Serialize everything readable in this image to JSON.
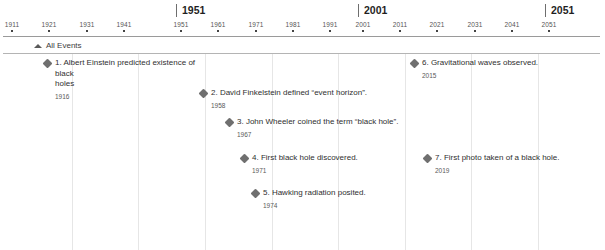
{
  "axis": {
    "major_labels": [
      {
        "text": "1951",
        "x": 176
      },
      {
        "text": "2001",
        "x": 358
      },
      {
        "text": "2051",
        "x": 545
      }
    ],
    "ticks": [
      {
        "label": "1911",
        "x": 12
      },
      {
        "label": "1921",
        "x": 49
      },
      {
        "label": "1931",
        "x": 87
      },
      {
        "label": "1941",
        "x": 124
      },
      {
        "label": "1951",
        "x": 181
      },
      {
        "label": "1961",
        "x": 218
      },
      {
        "label": "1971",
        "x": 256
      },
      {
        "label": "1981",
        "x": 293
      },
      {
        "label": "1991",
        "x": 330
      },
      {
        "label": "2001",
        "x": 363
      },
      {
        "label": "2011",
        "x": 400
      },
      {
        "label": "2021",
        "x": 437
      },
      {
        "label": "2031",
        "x": 475
      },
      {
        "label": "2041",
        "x": 512
      },
      {
        "label": "2051",
        "x": 549
      }
    ]
  },
  "group": {
    "label": "All Events",
    "caret_icon": "caret-up-icon",
    "expanded": true
  },
  "gridlines": [
    72,
    138,
    205,
    272,
    338,
    405,
    471,
    538
  ],
  "events": [
    {
      "index": "1.",
      "title": "1. Albert Einstein predicted existence of black\nholes",
      "year": "1916",
      "x": 44,
      "y": 4,
      "marker": "diamond-marker"
    },
    {
      "index": "2.",
      "title": "2. David Finkelstein defined “event horizon”.",
      "year": "1958",
      "x": 200,
      "y": 34,
      "marker": "diamond-marker"
    },
    {
      "index": "3.",
      "title": "3. John Wheeler coined the term “black hole”.",
      "year": "1967",
      "x": 226,
      "y": 63,
      "marker": "diamond-marker"
    },
    {
      "index": "4.",
      "title": "4. First black hole discovered.",
      "year": "1971",
      "x": 241,
      "y": 99,
      "marker": "diamond-marker"
    },
    {
      "index": "5.",
      "title": "5. Hawking radiation posited.",
      "year": "1974",
      "x": 252,
      "y": 134,
      "marker": "diamond-marker"
    },
    {
      "index": "6.",
      "title": "6. Gravitational waves observed.",
      "year": "2015",
      "x": 411,
      "y": 4,
      "marker": "diamond-marker"
    },
    {
      "index": "7.",
      "title": "7. First photo taken of a black hole.",
      "year": "2019",
      "x": 424,
      "y": 99,
      "marker": "diamond-marker"
    }
  ]
}
